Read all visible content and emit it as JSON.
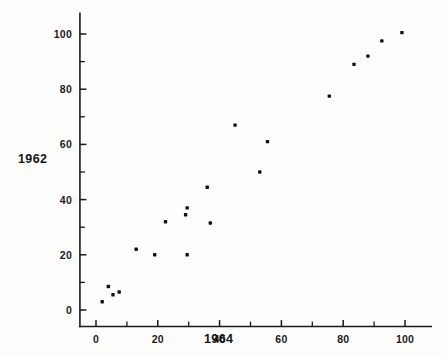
{
  "chart_data": {
    "type": "scatter",
    "title": "",
    "xlabel": "1964",
    "ylabel": "1962",
    "xlim": [
      -5,
      108
    ],
    "ylim": [
      -6,
      106
    ],
    "grid": false,
    "legend": null,
    "x_ticks_major": [
      0,
      20,
      40,
      60,
      80,
      100
    ],
    "x_ticks_minor": [
      10,
      30,
      50,
      70,
      90
    ],
    "y_ticks_major": [
      0,
      20,
      40,
      60,
      80,
      100
    ],
    "y_ticks_minor": [
      10,
      30,
      50,
      70,
      90
    ],
    "x_tick_labels": [
      "0",
      "20",
      "40",
      "60",
      "80",
      "100"
    ],
    "y_tick_labels": [
      "0",
      "20",
      "40",
      "60",
      "80",
      "100"
    ],
    "marker": "filled-square-dot",
    "marker_color": "#121212",
    "points": [
      {
        "x": 2.0,
        "y": 3.0
      },
      {
        "x": 4.0,
        "y": 8.5
      },
      {
        "x": 5.5,
        "y": 5.5
      },
      {
        "x": 7.5,
        "y": 6.5
      },
      {
        "x": 13.0,
        "y": 22.0
      },
      {
        "x": 19.0,
        "y": 20.0
      },
      {
        "x": 22.5,
        "y": 32.0
      },
      {
        "x": 29.0,
        "y": 34.5
      },
      {
        "x": 29.5,
        "y": 37.0
      },
      {
        "x": 29.5,
        "y": 20.0
      },
      {
        "x": 36.0,
        "y": 44.5
      },
      {
        "x": 37.0,
        "y": 31.5
      },
      {
        "x": 45.0,
        "y": 67.0
      },
      {
        "x": 53.0,
        "y": 50.0
      },
      {
        "x": 55.5,
        "y": 61.0
      },
      {
        "x": 75.5,
        "y": 77.5
      },
      {
        "x": 83.5,
        "y": 89.0
      },
      {
        "x": 88.0,
        "y": 92.0
      },
      {
        "x": 92.5,
        "y": 97.5
      },
      {
        "x": 99.0,
        "y": 100.5
      }
    ]
  }
}
